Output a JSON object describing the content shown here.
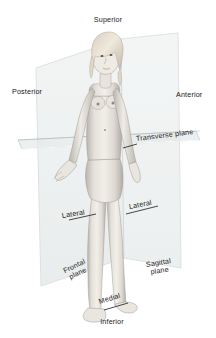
{
  "diagram": {
    "background_color": "#ffffff",
    "label_color": "#1a1a1a",
    "plane_fill_color": "#e9ecec",
    "plane_edge_color": "#c3c9c9",
    "figure_description": "Grayscale pencil illustration of a standing female figure in anatomical position, front view, arms slightly away from body, palms forward"
  },
  "labels": {
    "superior": "Superior",
    "inferior": "Inferior",
    "anterior": "Anterior",
    "posterior": "Posterior",
    "medial": "Medial",
    "lateral_left": "Lateral",
    "lateral_right": "Lateral",
    "transverse_plane": "Transverse plane",
    "frontal_plane_line1": "Frontal",
    "frontal_plane_line2": "plane",
    "sagittal_plane_line1": "Sagittal",
    "sagittal_plane_line2": "plane"
  }
}
